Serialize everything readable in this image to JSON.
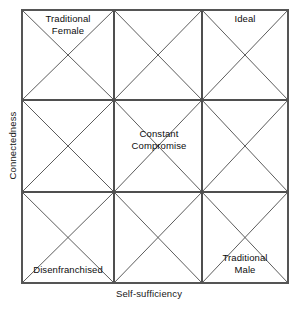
{
  "diagram": {
    "axes": {
      "x_label": "Self-sufficiency",
      "y_label": "Connectedness"
    },
    "grid": {
      "rows": 3,
      "columns": 3,
      "left": 22,
      "top": 10,
      "right": 288,
      "bottom": 283,
      "x_lines": [
        22,
        114,
        202,
        288
      ],
      "y_lines": [
        10,
        100,
        192,
        283
      ],
      "cell_marking": "both-diagonals",
      "line_color": "#4a4a4a",
      "border_color": "#555555",
      "background_color": "#ffffff"
    },
    "labels": {
      "top_left": "Traditional\nFemale",
      "top_right": "Ideal",
      "center": "Constant\nCompromise",
      "bottom_left": "Disenfranchised",
      "bottom_right": "Traditional\nMale"
    }
  }
}
